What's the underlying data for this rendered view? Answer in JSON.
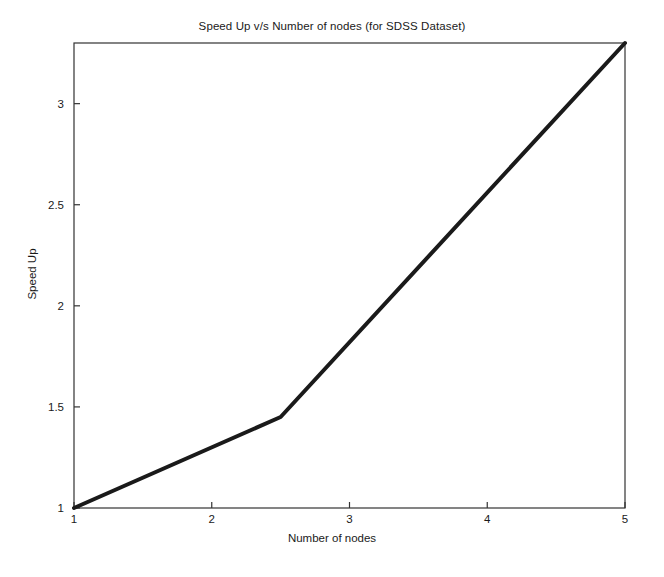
{
  "chart_data": {
    "type": "line",
    "title": "Speed Up v/s Number of nodes (for SDSS Dataset)",
    "xlabel": "Number of nodes",
    "ylabel": "Speed Up",
    "xlim": [
      1,
      5
    ],
    "ylim": [
      1,
      3.3
    ],
    "grid": false,
    "legend": null,
    "xticks": [
      1,
      2,
      3,
      4,
      5
    ],
    "xticklabels": [
      "1",
      "2",
      "3",
      "4",
      "5"
    ],
    "yticks": [
      1,
      1.5,
      2,
      2.5,
      3
    ],
    "yticklabels": [
      "1",
      "1.5",
      "2",
      "2.5",
      "3"
    ],
    "series": [
      {
        "name": "Speed Up",
        "color": "#1a1a1a",
        "linewidth": 4,
        "x": [
          1,
          2.5,
          5
        ],
        "values": [
          1.0,
          1.45,
          3.3
        ]
      }
    ]
  },
  "figure": {
    "background_color": "#ffffff",
    "axes_color": "#333333",
    "text_color": "#1a1a1a"
  }
}
